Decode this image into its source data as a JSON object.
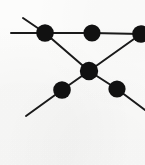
{
  "figure": {
    "title": "graph-diagram",
    "width": 145,
    "height": 165,
    "background_color": "#fcfcfb",
    "stroke_color": "#1a1a1a",
    "vertex_color": "#111111",
    "edge_width": 2.0,
    "vertex_radius": 8.6
  },
  "chart_data": {
    "type": "diagram",
    "title": "",
    "coordinate_space": {
      "width": 145,
      "height": 165,
      "origin": "top-left"
    },
    "vertices": [
      {
        "id": "v1",
        "label": "upper-left-vertex",
        "x": 45,
        "y": 33,
        "radius": 8.8,
        "degree": 3
      },
      {
        "id": "v2",
        "label": "upper-middle-vertex",
        "x": 92,
        "y": 33,
        "radius": 8.6,
        "degree": 2
      },
      {
        "id": "v3",
        "label": "upper-right-vertex",
        "x": 141,
        "y": 34,
        "radius": 8.8,
        "degree": 3
      },
      {
        "id": "v4",
        "label": "center-vertex",
        "x": 89,
        "y": 71,
        "radius": 9.2,
        "degree": 4
      },
      {
        "id": "v5",
        "label": "lower-left-vertex",
        "x": 62,
        "y": 90,
        "radius": 8.8,
        "degree": 2
      },
      {
        "id": "v6",
        "label": "lower-right-vertex",
        "x": 117,
        "y": 89,
        "radius": 8.6,
        "degree": 2
      }
    ],
    "edges": [
      {
        "id": "e1",
        "label": "top-horizontal-left-segment",
        "from": "v1",
        "to": "v2"
      },
      {
        "id": "e2",
        "label": "top-horizontal-right-segment",
        "from": "v2",
        "to": "v3"
      },
      {
        "id": "e3",
        "label": "upper-left-to-center-diagonal",
        "from": "v1",
        "to": "v4"
      },
      {
        "id": "e4",
        "label": "center-to-upper-right-diagonal",
        "from": "v4",
        "to": "v3"
      },
      {
        "id": "e5",
        "label": "center-to-lower-left-diagonal",
        "from": "v4",
        "to": "v5"
      },
      {
        "id": "e6",
        "label": "center-to-lower-right-diagonal",
        "from": "v4",
        "to": "v6"
      }
    ],
    "external_legs": [
      {
        "id": "l1",
        "label": "left-horizontal-leg",
        "from": "v1",
        "x2": 11,
        "y2": 33
      },
      {
        "id": "l2",
        "label": "upper-left-diagonal-leg",
        "from": "v1",
        "x2": 23,
        "y2": 18
      },
      {
        "id": "l3",
        "label": "lower-left-diagonal-leg",
        "from": "v5",
        "x2": 26,
        "y2": 116
      },
      {
        "id": "l4",
        "label": "lower-right-diagonal-leg",
        "from": "v6",
        "x2": 145,
        "y2": 110
      }
    ]
  }
}
